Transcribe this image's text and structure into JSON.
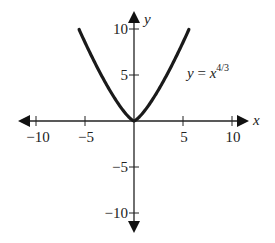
{
  "chart_data": {
    "type": "line",
    "title": "",
    "xlabel": "x",
    "ylabel": "y",
    "xlim": [
      -10,
      10
    ],
    "ylim": [
      -10,
      10
    ],
    "grid": false,
    "x_ticks": [
      -10,
      -5,
      5,
      10
    ],
    "y_ticks": [
      -10,
      -5,
      5,
      10
    ],
    "x_tick_labels": [
      "−10",
      "−5",
      "5",
      "10"
    ],
    "y_tick_labels": [
      "−10",
      "−5",
      "5",
      "10"
    ],
    "series": [
      {
        "name": "y = x^(4/3)",
        "function": "y = x^(4/3)",
        "x_range": [
          -5.6,
          5.6
        ],
        "x": [
          -5.6,
          -5,
          -4,
          -3,
          -2,
          -1,
          0,
          1,
          2,
          3,
          4,
          5,
          5.6
        ],
        "values": [
          9.94,
          8.55,
          6.35,
          4.33,
          2.52,
          1.0,
          0,
          1.0,
          2.52,
          4.33,
          6.35,
          8.55,
          9.94
        ],
        "color": "#1a1a1a"
      }
    ],
    "annotations": [
      {
        "text": "y = x^4/3",
        "position": "right of y-axis near y=5"
      }
    ]
  },
  "labels": {
    "x_axis": "x",
    "y_axis": "y",
    "eq_y": "y",
    "eq_eq": " = ",
    "eq_x": "x",
    "eq_exp": "4/3",
    "xt_m10": "−10",
    "xt_m5": "−5",
    "xt_5": "5",
    "xt_10": "10",
    "yt_10": "10",
    "yt_5": "5",
    "yt_m5": "−5",
    "yt_m10": "−10"
  }
}
